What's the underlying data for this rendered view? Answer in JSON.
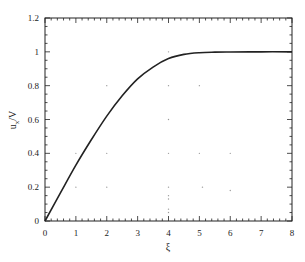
{
  "chart_data": {
    "type": "line",
    "title": "",
    "xlabel": "ξ",
    "ylabel": "u_x/V",
    "ylabel_main": "u",
    "ylabel_sub": "x",
    "ylabel_rest": "/V",
    "xlim": [
      0,
      8
    ],
    "ylim": [
      0,
      1.2
    ],
    "grid": false,
    "legend": null,
    "x_ticks": [
      0,
      1,
      2,
      3,
      4,
      5,
      6,
      7,
      8
    ],
    "x_tick_labels": [
      "0",
      "1",
      "2",
      "3",
      "4",
      "5",
      "6",
      "7",
      "8"
    ],
    "y_ticks": [
      0,
      0.2,
      0.4,
      0.6,
      0.8,
      1.0,
      1.2
    ],
    "y_tick_labels": [
      "0",
      "0.2",
      "0.4",
      "0.6",
      "0.8",
      "1",
      "1.2"
    ],
    "series": [
      {
        "name": "u_x/V",
        "x": [
          0,
          0.5,
          1,
          1.5,
          2,
          2.5,
          3,
          3.5,
          4,
          4.5,
          5,
          5.5,
          6,
          7,
          8
        ],
        "values": [
          0,
          0.166,
          0.33,
          0.48,
          0.62,
          0.74,
          0.84,
          0.91,
          0.96,
          0.985,
          0.995,
          0.998,
          0.999,
          1.0,
          1.0
        ]
      }
    ],
    "stray_dots": [
      [
        1,
        0.4
      ],
      [
        2,
        0.4
      ],
      [
        1,
        0.2
      ],
      [
        2,
        0.2
      ],
      [
        2,
        0.8
      ],
      [
        4,
        1.0
      ],
      [
        4,
        0.8
      ],
      [
        5,
        0.8
      ],
      [
        4,
        0.6
      ],
      [
        4,
        0.4
      ],
      [
        5,
        0.4
      ],
      [
        6,
        0.4
      ],
      [
        4,
        0.2
      ],
      [
        5.1,
        0.2
      ],
      [
        6,
        0.18
      ],
      [
        4,
        0.15
      ],
      [
        4,
        0.13
      ],
      [
        4,
        0.07
      ],
      [
        4,
        0.05
      ]
    ]
  }
}
